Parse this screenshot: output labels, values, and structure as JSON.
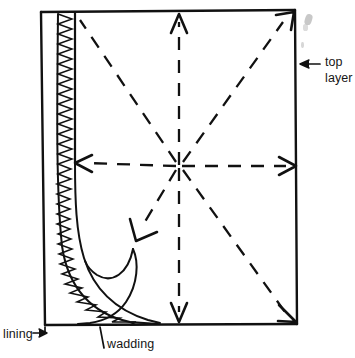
{
  "figure": {
    "type": "line-drawing-diagram",
    "background_color": "#ffffff",
    "ink_color": "#111111",
    "labels": {
      "top_layer": "top\nlayer",
      "top_layer_line1": "top",
      "top_layer_line2": "layer",
      "lining": "lining",
      "wadding": "wadding"
    },
    "annotations": [
      {
        "name": "top-layer-callout",
        "text": "top layer",
        "arrow": "points-left",
        "target": "right edge of panel"
      },
      {
        "name": "lining-callout",
        "text": "lining",
        "arrow": "points-right",
        "target": "bottom-left outer corner"
      },
      {
        "name": "wadding-callout",
        "text": "wadding",
        "arrow": "leader-line-up",
        "target": "hatched wadding band at bottom"
      }
    ],
    "direction_arrows": [
      {
        "name": "arrow-up",
        "direction": "up",
        "target": "top edge"
      },
      {
        "name": "arrow-down",
        "direction": "down",
        "target": "bottom edge"
      },
      {
        "name": "arrow-left",
        "direction": "left",
        "target": "left inner edge"
      },
      {
        "name": "arrow-right",
        "direction": "right",
        "target": "right edge"
      },
      {
        "name": "arrow-up-right",
        "direction": "up-right",
        "target": "top-right corner"
      },
      {
        "name": "arrow-down-right",
        "direction": "down-right",
        "target": "bottom-right corner"
      },
      {
        "name": "arrow-down-left",
        "direction": "down-left",
        "target": "interior lower-left"
      }
    ],
    "elements": {
      "panel": "outer quilt panel rectangle",
      "wadding_band": "zigzag hatched vertical band along left side curving to bottom",
      "fold_curves": "two curved fold lines in lower-left region",
      "dashed_star": "eight dashed rays radiating from centre point"
    },
    "smudges_present": true
  }
}
